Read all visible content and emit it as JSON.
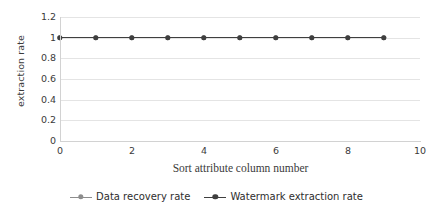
{
  "chart_data": {
    "type": "line",
    "title": "",
    "xlabel": "Sort attribute column number",
    "ylabel": "extraction rate",
    "xlim": [
      0,
      10
    ],
    "ylim": [
      0,
      1.2
    ],
    "grid": true,
    "legend_position": "bottom",
    "x": [
      0,
      1,
      2,
      3,
      4,
      5,
      6,
      7,
      8,
      9
    ],
    "xticks": [
      "0",
      "2",
      "4",
      "6",
      "8",
      "10"
    ],
    "xtick_values": [
      0,
      2,
      4,
      6,
      8,
      10
    ],
    "yticks": [
      "0",
      "0.2",
      "0.4",
      "0.6",
      "0.8",
      "1",
      "1.2"
    ],
    "ytick_values": [
      0,
      0.2,
      0.4,
      0.6,
      0.8,
      1,
      1.2
    ],
    "series": [
      {
        "name": "Data recovery rate",
        "values": [
          1,
          1,
          1,
          1,
          1,
          1,
          1,
          1,
          1,
          1
        ],
        "color": "#8d8d8d"
      },
      {
        "name": "Watermark extraction rate",
        "values": [
          1,
          1,
          1,
          1,
          1,
          1,
          1,
          1,
          1,
          1
        ],
        "color": "#3f3f3f"
      }
    ]
  },
  "legend": {
    "entries": [
      {
        "label": "Data recovery rate",
        "color": "#8d8d8d"
      },
      {
        "label": "Watermark extraction rate",
        "color": "#3f3f3f"
      }
    ]
  },
  "axes": {
    "y_title": "extraction rate",
    "x_title": "Sort attribute column number",
    "y_tick_labels": [
      "1.2",
      "1",
      "0.8",
      "0.6",
      "0.4",
      "0.2",
      "0"
    ],
    "x_tick_labels": [
      "0",
      "2",
      "4",
      "6",
      "8",
      "10"
    ]
  },
  "colors": {
    "gridline": "#e4e4e4",
    "axis": "#d2d2d2",
    "text": "#3b3b3b",
    "series_primary": "#3f3f3f",
    "series_secondary": "#8d8d8d",
    "background": "#ffffff"
  }
}
